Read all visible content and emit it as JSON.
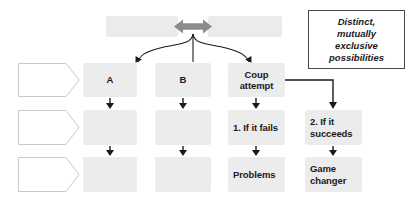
{
  "diagram": {
    "title_bar": {
      "left_box_text": "",
      "right_box_text": "",
      "arrow_icon": "double-headed-arrow-icon",
      "arrow_color": "#808080"
    },
    "callout": {
      "text": "Distinct, mutually exclusive possibilities",
      "line1": "Distinct,",
      "line2": "mutually",
      "line3": "exclusive",
      "line4": "possibilities",
      "border_color": "#4a4a4a"
    },
    "row_labels": [
      {
        "text": ""
      },
      {
        "text": ""
      },
      {
        "text": ""
      }
    ],
    "columns": [
      {
        "id": "column-a",
        "cells": [
          {
            "text": "A",
            "filled": true
          },
          {
            "text": "",
            "filled": true
          },
          {
            "text": "",
            "filled": true
          }
        ]
      },
      {
        "id": "column-b",
        "cells": [
          {
            "text": "B",
            "filled": true
          },
          {
            "text": "",
            "filled": true
          },
          {
            "text": "",
            "filled": true
          }
        ]
      },
      {
        "id": "column-coup",
        "cells": [
          {
            "text": "Coup attempt",
            "filled": true
          },
          {
            "text": "1. If it fails",
            "filled": true
          },
          {
            "text": "Problems",
            "filled": true
          }
        ]
      },
      {
        "id": "column-succeeds",
        "cells": [
          {
            "text": "",
            "filled": false
          },
          {
            "text": "2. If it succeeds",
            "filled": true
          },
          {
            "text": "Game changer",
            "filled": true
          }
        ]
      }
    ],
    "colors": {
      "box_fill": "#ececec",
      "header_fill": "#ebebeb",
      "line": "#1a1a1a",
      "chevron_border": "#c9c9c9"
    }
  }
}
